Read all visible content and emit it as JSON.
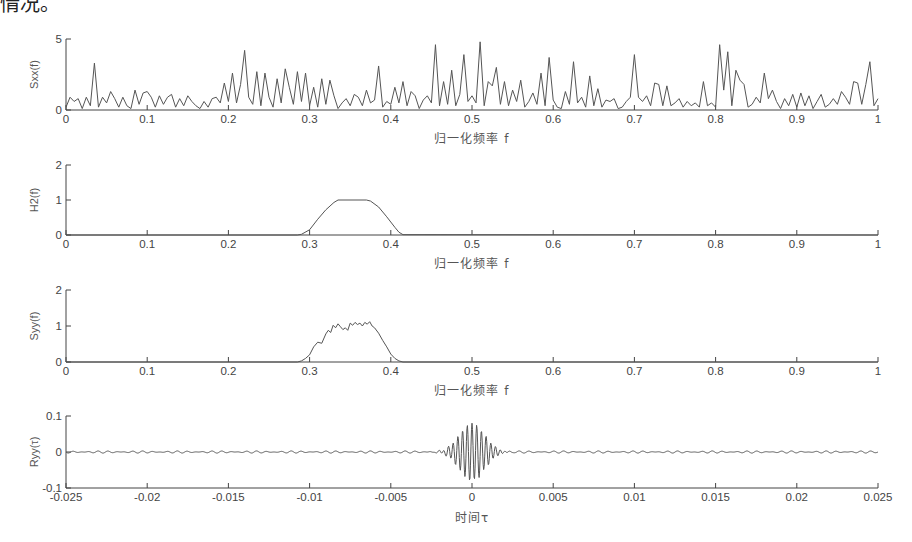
{
  "page": {
    "cut_text": "情况。"
  },
  "chart_data": [
    {
      "type": "line",
      "id": "sxx",
      "title": "",
      "ylabel": "Sxx(f)",
      "xlabel": "归一化频率 f",
      "xlim": [
        0,
        1
      ],
      "ylim": [
        0,
        5
      ],
      "xticks": [
        0,
        0.1,
        0.2,
        0.3,
        0.4,
        0.5,
        0.6,
        0.7,
        0.8,
        0.9,
        1
      ],
      "xtick_labels": [
        "0",
        "0.1",
        "0.2",
        "0.3",
        "0.4",
        "0.5",
        "0.6",
        "0.7",
        "0.8",
        "0.9",
        "1"
      ],
      "yticks": [
        0,
        5
      ],
      "ytick_labels": [
        "0",
        "5"
      ],
      "description": "Random noise power spectrum, values mostly 0-3 with peaks up to ~4.9",
      "x": [
        0,
        0.005,
        0.01,
        0.015,
        0.02,
        0.025,
        0.03,
        0.035,
        0.04,
        0.045,
        0.05,
        0.055,
        0.06,
        0.065,
        0.07,
        0.075,
        0.08,
        0.085,
        0.09,
        0.095,
        0.1,
        0.105,
        0.11,
        0.115,
        0.12,
        0.125,
        0.13,
        0.135,
        0.14,
        0.145,
        0.15,
        0.155,
        0.16,
        0.165,
        0.17,
        0.175,
        0.18,
        0.185,
        0.19,
        0.195,
        0.2,
        0.205,
        0.21,
        0.215,
        0.22,
        0.225,
        0.23,
        0.235,
        0.24,
        0.245,
        0.25,
        0.255,
        0.26,
        0.265,
        0.27,
        0.275,
        0.28,
        0.285,
        0.29,
        0.295,
        0.3,
        0.305,
        0.31,
        0.315,
        0.32,
        0.325,
        0.33,
        0.335,
        0.34,
        0.345,
        0.35,
        0.355,
        0.36,
        0.365,
        0.37,
        0.375,
        0.38,
        0.385,
        0.39,
        0.395,
        0.4,
        0.405,
        0.41,
        0.415,
        0.42,
        0.425,
        0.43,
        0.435,
        0.44,
        0.445,
        0.45,
        0.455,
        0.46,
        0.465,
        0.47,
        0.475,
        0.48,
        0.485,
        0.49,
        0.495,
        0.5,
        0.505,
        0.51,
        0.515,
        0.52,
        0.525,
        0.53,
        0.535,
        0.54,
        0.545,
        0.55,
        0.555,
        0.56,
        0.565,
        0.57,
        0.575,
        0.58,
        0.585,
        0.59,
        0.595,
        0.6,
        0.605,
        0.61,
        0.615,
        0.62,
        0.625,
        0.63,
        0.635,
        0.64,
        0.645,
        0.65,
        0.655,
        0.66,
        0.665,
        0.67,
        0.675,
        0.68,
        0.685,
        0.69,
        0.695,
        0.7,
        0.705,
        0.71,
        0.715,
        0.72,
        0.725,
        0.73,
        0.735,
        0.74,
        0.745,
        0.75,
        0.755,
        0.76,
        0.765,
        0.77,
        0.775,
        0.78,
        0.785,
        0.79,
        0.795,
        0.8,
        0.805,
        0.81,
        0.815,
        0.82,
        0.825,
        0.83,
        0.835,
        0.84,
        0.845,
        0.85,
        0.855,
        0.86,
        0.865,
        0.87,
        0.875,
        0.88,
        0.885,
        0.89,
        0.895,
        0.9,
        0.905,
        0.91,
        0.915,
        0.92,
        0.925,
        0.93,
        0.935,
        0.94,
        0.945,
        0.95,
        0.955,
        0.96,
        0.965,
        0.97,
        0.975,
        0.98,
        0.985,
        0.99,
        0.995,
        1
      ],
      "values": [
        0.2,
        0.9,
        0.6,
        0.8,
        0.1,
        0.9,
        0.3,
        3.3,
        0.2,
        0.9,
        0.5,
        1.3,
        0.8,
        0.2,
        0.9,
        0.3,
        0.1,
        1.4,
        0.4,
        1.2,
        1.3,
        0.9,
        0.2,
        1.0,
        0.4,
        0.9,
        1.1,
        0.2,
        0.8,
        0.3,
        1.0,
        0.6,
        0.3,
        0.1,
        0.6,
        0.2,
        0.8,
        0.9,
        0.5,
        1.9,
        0.6,
        2.6,
        0.5,
        1.8,
        4.2,
        0.9,
        0.4,
        2.7,
        0.3,
        2.6,
        0.9,
        0.2,
        2.2,
        0.5,
        2.9,
        1.6,
        0.4,
        2.7,
        0.6,
        2.6,
        0.3,
        1.6,
        0.2,
        2.2,
        0.4,
        2.1,
        1.0,
        0.1,
        0.5,
        0.8,
        0.3,
        1.1,
        0.9,
        0.3,
        1.4,
        0.5,
        0.7,
        3.1,
        0.2,
        0.6,
        0.4,
        1.6,
        0.5,
        2.0,
        0.3,
        1.3,
        1.0,
        0.1,
        0.7,
        1.0,
        0.5,
        4.6,
        0.3,
        2.0,
        0.4,
        2.8,
        0.3,
        1.1,
        3.9,
        0.6,
        1.0,
        0.5,
        4.8,
        0.3,
        2.0,
        1.7,
        3.0,
        0.4,
        2.0,
        0.3,
        1.4,
        0.6,
        2.1,
        0.2,
        0.6,
        1.2,
        0.4,
        2.6,
        0.3,
        3.7,
        0.7,
        0.2,
        0.1,
        1.3,
        0.4,
        3.4,
        0.5,
        0.9,
        0.2,
        2.4,
        0.3,
        1.5,
        0.2,
        0.7,
        0.6,
        0.8,
        0.1,
        0.2,
        0.6,
        0.9,
        3.9,
        0.9,
        0.6,
        1.0,
        0.3,
        1.9,
        1.8,
        0.3,
        1.7,
        0.3,
        0.5,
        0.8,
        0.2,
        0.6,
        0.3,
        0.5,
        0.2,
        2.0,
        0.3,
        0.5,
        0.2,
        4.6,
        1.4,
        4.1,
        0.3,
        2.8,
        2.1,
        1.8,
        0.2,
        0.4,
        0.9,
        0.5,
        2.6,
        0.8,
        1.4,
        0.6,
        0.1,
        0.8,
        0.3,
        1.1,
        0.2,
        1.2,
        0.3,
        1.0,
        0.1,
        0.6,
        1.1,
        0.2,
        0.4,
        0.8,
        0.4,
        1.3,
        0.9,
        0.4,
        2.0,
        1.9,
        0.4,
        1.8,
        3.4,
        0.3,
        0.8,
        3.8,
        1.1,
        0.4,
        0.2,
        2.9,
        0.6,
        1.9,
        0.3,
        1.2
      ]
    },
    {
      "type": "line",
      "id": "h2",
      "ylabel": "H2(f)",
      "xlabel": "归一化频率 f",
      "xlim": [
        0,
        1
      ],
      "ylim": [
        0,
        2
      ],
      "xticks": [
        0,
        0.1,
        0.2,
        0.3,
        0.4,
        0.5,
        0.6,
        0.7,
        0.8,
        0.9,
        1
      ],
      "xtick_labels": [
        "0",
        "0.1",
        "0.2",
        "0.3",
        "0.4",
        "0.5",
        "0.6",
        "0.7",
        "0.8",
        "0.9",
        "1"
      ],
      "yticks": [
        0,
        1,
        2
      ],
      "ytick_labels": [
        "0",
        "1",
        "2"
      ],
      "description": "Band-pass filter magnitude squared: ~0 outside 0.29-0.415, rises to 1.0 plateau between ~0.335 and ~0.37",
      "x": [
        0,
        0.285,
        0.29,
        0.3,
        0.31,
        0.32,
        0.33,
        0.335,
        0.37,
        0.375,
        0.385,
        0.395,
        0.405,
        0.41,
        0.415,
        1
      ],
      "values": [
        0,
        0,
        0.02,
        0.15,
        0.45,
        0.72,
        0.93,
        1.0,
        1.0,
        0.97,
        0.8,
        0.52,
        0.22,
        0.08,
        0.01,
        0
      ]
    },
    {
      "type": "line",
      "id": "syy",
      "ylabel": "Syy(f)",
      "xlabel": "归一化频率 f",
      "xlim": [
        0,
        1
      ],
      "ylim": [
        0,
        2
      ],
      "xticks": [
        0,
        0.1,
        0.2,
        0.3,
        0.4,
        0.5,
        0.6,
        0.7,
        0.8,
        0.9,
        1
      ],
      "xtick_labels": [
        "0",
        "0.1",
        "0.2",
        "0.3",
        "0.4",
        "0.5",
        "0.6",
        "0.7",
        "0.8",
        "0.9",
        "1"
      ],
      "yticks": [
        0,
        1,
        2
      ],
      "ytick_labels": [
        "0",
        "1",
        "2"
      ],
      "description": "Output power spectrum: noisy band between 0.29 and 0.415 peaking near 1.1",
      "x": [
        0,
        0.285,
        0.29,
        0.295,
        0.3,
        0.305,
        0.31,
        0.315,
        0.32,
        0.323,
        0.326,
        0.329,
        0.332,
        0.335,
        0.338,
        0.341,
        0.344,
        0.347,
        0.35,
        0.353,
        0.356,
        0.359,
        0.362,
        0.365,
        0.368,
        0.371,
        0.374,
        0.377,
        0.38,
        0.385,
        0.39,
        0.395,
        0.4,
        0.405,
        0.41,
        0.415,
        1
      ],
      "values": [
        0,
        0,
        0.03,
        0.1,
        0.2,
        0.42,
        0.55,
        0.52,
        0.78,
        0.88,
        0.82,
        1.02,
        0.95,
        1.06,
        0.98,
        0.9,
        0.95,
        0.88,
        1.08,
        1.02,
        1.1,
        1.04,
        1.08,
        1.0,
        1.1,
        1.05,
        1.12,
        1.0,
        0.95,
        0.8,
        0.6,
        0.42,
        0.22,
        0.1,
        0.03,
        0.0,
        0
      ]
    },
    {
      "type": "line",
      "id": "ryy",
      "ylabel": "Ryy(τ)",
      "xlabel": "时间τ",
      "xlim": [
        -0.025,
        0.025
      ],
      "ylim": [
        -0.1,
        0.1
      ],
      "xticks": [
        -0.025,
        -0.02,
        -0.015,
        -0.01,
        -0.005,
        0,
        0.005,
        0.01,
        0.015,
        0.02,
        0.025
      ],
      "xtick_labels": [
        "-0.025",
        "-0.02",
        "-0.015",
        "-0.01",
        "-0.005",
        "0",
        "0.005",
        "0.01",
        "0.015",
        "0.02",
        "0.025"
      ],
      "yticks": [
        -0.1,
        0,
        0.1
      ],
      "ytick_labels": [
        "-0.1",
        "0",
        "0.1"
      ],
      "description": "Autocorrelation: oscillating burst centered at τ=0 with amplitude ~±0.08 within |τ|<0.0012, small ripple (~±0.003) elsewhere",
      "peak": {
        "tau": 0,
        "value": 0.08
      },
      "min": {
        "tau": 0,
        "value": -0.09
      },
      "envelope_halfwidth": 0.0012,
      "oscillation_period": 0.00029,
      "ripple_amplitude": 0.003
    }
  ]
}
